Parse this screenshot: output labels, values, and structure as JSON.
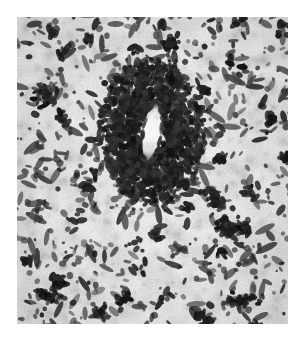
{
  "figure": {
    "domain_kind": "histopathology-micrograph",
    "title": "",
    "caption": "",
    "label": "",
    "scale_bar_text": "",
    "magnification_text": "",
    "annotations": []
  },
  "page": {
    "background_color": "#ffffff",
    "width_px": 305,
    "height_px": 340
  },
  "image_plate": {
    "name": "tissue-micrograph",
    "left_px": 17,
    "top_px": 17,
    "width_px": 271,
    "height_px": 307,
    "stain": "hematoxylin-eosin-grayscale",
    "color_mode": "grayscale",
    "background_color": "#e9e9e6",
    "paper_grain_color": "#d8d8d4",
    "nuclei_color": "#2b2b2b",
    "dark_cluster_color": "#161616",
    "lumen_color": "#f4f4f2",
    "border_visible": false
  },
  "content_features": {
    "central_vessel": {
      "name": "central-blood-vessel",
      "lumen_center_x_px": 152,
      "lumen_center_y_px": 132,
      "lumen_width_px": 16,
      "lumen_height_px": 58,
      "lumen_rotation_deg": 8,
      "cuff_radius_x_px": 52,
      "cuff_radius_y_px": 72,
      "description": "pale elongated lumen surrounded by dense perivascular inflammatory cuff"
    },
    "secondary_vessels": [
      {
        "name": "vessel-upper-left",
        "x_px": 45,
        "y_px": 96,
        "w_px": 22,
        "h_px": 14,
        "angle_deg": 35
      },
      {
        "name": "vessel-lower-right",
        "x_px": 240,
        "y_px": 300,
        "w_px": 34,
        "h_px": 10,
        "angle_deg": -12
      },
      {
        "name": "vessel-lower-left",
        "x_px": 48,
        "y_px": 296,
        "w_px": 26,
        "h_px": 9,
        "angle_deg": 20
      },
      {
        "name": "vessel-mid-right",
        "x_px": 236,
        "y_px": 228,
        "w_px": 28,
        "h_px": 9,
        "angle_deg": -25
      }
    ],
    "nuclei_count_estimate": 2300,
    "dense_cluster_count_estimate": 46,
    "texture_seed": 20240617
  },
  "render_params": {
    "base_gray_min": 218,
    "base_gray_max": 241,
    "grain_amplitude": 13,
    "nucleus_min_radius_px": 1.1,
    "nucleus_max_radius_px": 3.4,
    "elongated_fraction": 0.55,
    "cuff_density_multiplier": 5.0
  }
}
